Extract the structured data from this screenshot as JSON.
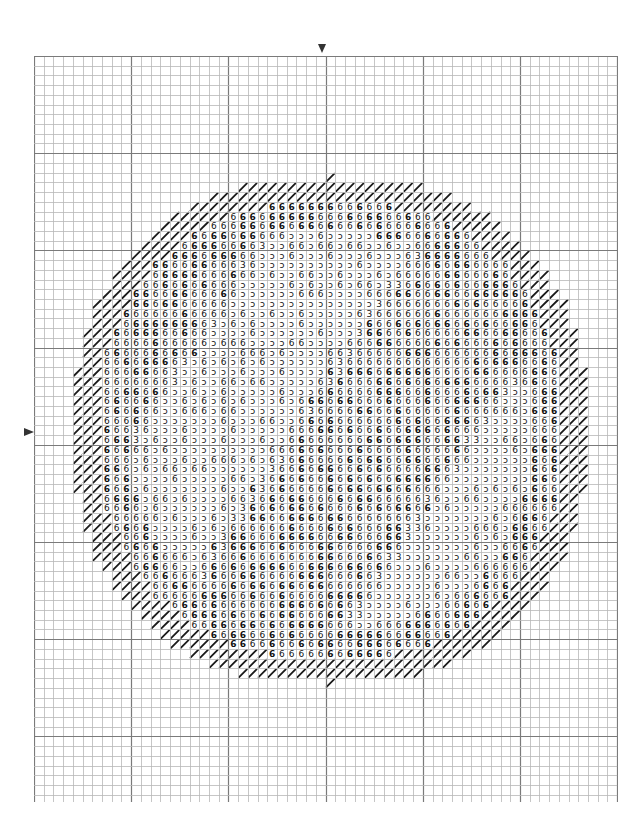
{
  "chart": {
    "type": "cross-stitch-pattern",
    "grid": {
      "columns": 60,
      "rows": 77,
      "cell_size_px": 9.72,
      "major_every": 10,
      "minor_line_color": "#b8b8b8",
      "major_line_color": "#7a7a7a",
      "border_color": "#8a8a8a"
    },
    "center_markers": {
      "top": {
        "glyph": "▼",
        "column": 30
      },
      "left": {
        "glyph": "▶",
        "row": 38
      }
    },
    "shape": {
      "center_col": 30.5,
      "center_row": 38.5,
      "radius_x": 26.5,
      "radius_y": 26.0,
      "outline_thickness_cells": 2.6
    },
    "symbols": {
      "outline": {
        "glyph": "/",
        "name": "backstitch-diagonal",
        "color": "#1a1a1a"
      },
      "light": {
        "glyph": "ɔ",
        "name": "light-grey"
      },
      "mid": {
        "glyph": "3",
        "name": "mid-grey"
      },
      "dark": {
        "glyph": "6",
        "name": "dark-grey"
      },
      "darkest": {
        "glyph": "6",
        "name": "darkest-grey-bold"
      }
    },
    "symbol_color": "#111111"
  }
}
